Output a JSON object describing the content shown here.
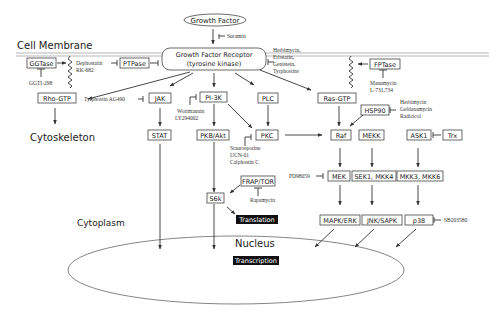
{
  "diagram": {
    "regions": {
      "cell_membrane": "Cell Membrane",
      "cytoskeleton": "Cytoskeleton",
      "cytoplasm": "Cytoplasm",
      "nucleus": "Nucleus"
    },
    "nodes": {
      "growth_factor": "Growth Factor",
      "receptor_line1": "Growth Factor Receptor",
      "receptor_line2": "(tyrosine kinase)",
      "ggtase": "GGTase",
      "ptpase": "PTPase",
      "fptase": "FPTase",
      "rho_gtp": "Rho-GTP",
      "jak": "JAK",
      "pi3k": "PI-3K",
      "plc": "PLC",
      "ras_gtp": "Ras-GTP",
      "stat": "STAT",
      "pkb_akt": "PKB/Akt",
      "pkc": "PKC",
      "hsp90": "HSP90",
      "raf": "Raf",
      "mekk": "MEKK",
      "ask1": "ASK1",
      "trx": "Trx",
      "frap_tor": "FRAP/TOR",
      "s6k": "S6k",
      "mek": "MEK",
      "sek1_mkk4": "SEK1, MKK4",
      "mkk3_mkk6": "MKK3, MKK6",
      "mapk_erk": "MAPK/ERK",
      "jnk_sapk": "JNK/SAPK",
      "p38": "p38",
      "translation": "Translation",
      "transcription": "Transcription"
    },
    "inhibitors": {
      "suramin": "Suramin",
      "receptor_inhibitors": [
        "Herbimycin,",
        "Erbstatin,",
        "Genistein,",
        "Tyrphostins"
      ],
      "dephostatin": [
        "Dephostatin",
        "RK-682"
      ],
      "ggti": "GGTI-298",
      "manumycin": [
        "Manumycin",
        "L-731,734"
      ],
      "tyrphostin_ag490": "Tyrphostin AG490",
      "wortmannin": [
        "Wortmannin",
        "LY294002"
      ],
      "hsp90_inhibitors": [
        "Herbimycin",
        "Geldanamycin",
        "Radicicol"
      ],
      "pkc_inhibitors": [
        "Staurosporine",
        "UCN-01",
        "Calphostin C"
      ],
      "rapamycin": "Rapamycin",
      "pd98059": "PD98059",
      "sb203580": "SB203580"
    }
  }
}
